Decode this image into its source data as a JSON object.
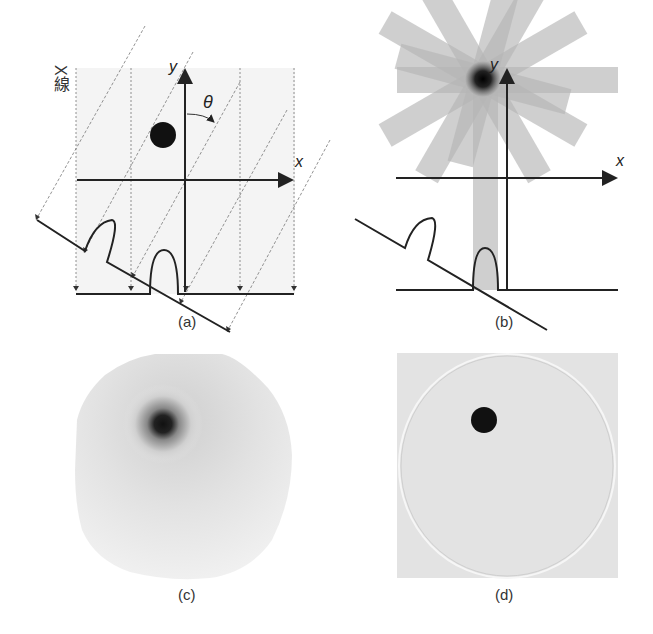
{
  "figure": {
    "panels": [
      {
        "id": "a",
        "caption": "(a)",
        "description": "Parallel X-ray projections at angle theta producing 1D profiles on detector lines"
      },
      {
        "id": "b",
        "caption": "(b)",
        "description": "Simple back-projection of profiles along many angles forming star pattern"
      },
      {
        "id": "c",
        "caption": "(c)",
        "description": "Blurred back-projection reconstruction image"
      },
      {
        "id": "d",
        "caption": "(d)",
        "description": "Filtered back-projection reconstruction with sharp dot"
      }
    ],
    "panel_a": {
      "xray_label": "X線",
      "theta_label": "θ",
      "x_axis_label": "x",
      "y_axis_label": "y",
      "caption": "(a)"
    },
    "panel_b": {
      "x_axis_label": "x",
      "y_axis_label": "y",
      "caption": "(b)"
    },
    "panel_c": {
      "caption": "(c)"
    },
    "panel_d": {
      "caption": "(d)"
    },
    "colors": {
      "line": "#222222",
      "dashed": "#666666",
      "background_tint": "#f3f3f3",
      "beam": "#bdbdbd",
      "dot": "#111111",
      "recon_bg": "#e6e6e6"
    }
  }
}
